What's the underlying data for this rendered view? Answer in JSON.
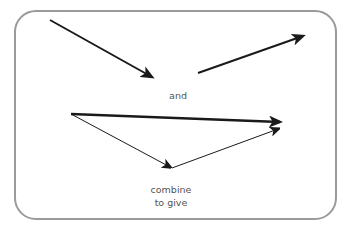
{
  "diagram": {
    "labels": {
      "and": "and",
      "combine_line1": "combine",
      "combine_line2": "to give"
    },
    "colors": {
      "arrow": "#1a1a1a",
      "frame": "#9a9a9a",
      "text": "#555555"
    },
    "vectors": [
      {
        "name": "vector-a",
        "from": [
          50,
          20
        ],
        "to": [
          154,
          78
        ],
        "weight": "medium"
      },
      {
        "name": "vector-b",
        "from": [
          198,
          73
        ],
        "to": [
          305,
          35
        ],
        "weight": "medium"
      },
      {
        "name": "resultant",
        "from": [
          71,
          114
        ],
        "to": [
          282,
          122
        ],
        "weight": "bold"
      },
      {
        "name": "vector-a-placed",
        "from": [
          71,
          114
        ],
        "to": [
          172,
          168
        ],
        "weight": "thin"
      },
      {
        "name": "vector-b-placed",
        "from": [
          172,
          168
        ],
        "to": [
          280,
          128
        ],
        "weight": "thin"
      }
    ]
  }
}
